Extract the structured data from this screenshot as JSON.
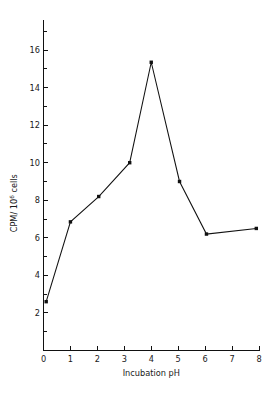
{
  "chart_data": {
    "type": "line",
    "title": "",
    "subtitle": "",
    "xlabel": "Incubation pH",
    "ylabel_main": "CPM/ 10",
    "ylabel_sup": "6",
    "ylabel_tail": " cells",
    "ylabel_full": "CPM/ 10⁶ cells",
    "xlim": [
      0,
      8
    ],
    "ylim": [
      0,
      17.6
    ],
    "grid": false,
    "legend": "none",
    "x_ticks_major": [
      0,
      1,
      2,
      3,
      4,
      5,
      6,
      7,
      8
    ],
    "x_tick_labels": [
      "0",
      "1",
      "2",
      "3",
      "4",
      "5",
      "6",
      "7",
      "8"
    ],
    "y_ticks_major": [
      2,
      4,
      6,
      8,
      10,
      12,
      14,
      16
    ],
    "y_tick_labels": [
      "2",
      "4",
      "6",
      "8",
      "10",
      "12",
      "14",
      "16"
    ],
    "y_ticks_minor": [
      1,
      3,
      5,
      7,
      9,
      11,
      13,
      15,
      17
    ],
    "series": [
      {
        "name": "CPM per 10^6 cells vs incubation pH",
        "marker": "square",
        "x": [
          0.1,
          1.0,
          2.05,
          3.2,
          4.0,
          5.05,
          6.05,
          7.9
        ],
        "y": [
          2.6,
          6.85,
          8.2,
          10.0,
          15.35,
          9.0,
          6.2,
          6.5
        ]
      }
    ],
    "points_readable": [
      {
        "x": 0.1,
        "y": 2.6
      },
      {
        "x": 1.0,
        "y": 6.85
      },
      {
        "x": 2.05,
        "y": 8.2
      },
      {
        "x": 3.2,
        "y": 10.0
      },
      {
        "x": 4.0,
        "y": 15.35
      },
      {
        "x": 5.05,
        "y": 9.0
      },
      {
        "x": 6.05,
        "y": 6.2
      },
      {
        "x": 7.9,
        "y": 6.5
      }
    ],
    "colors": {
      "line": "#111111",
      "marker": "#111111",
      "axis": "#111111",
      "background": "#ffffff",
      "text": "#1a1a1a"
    }
  }
}
